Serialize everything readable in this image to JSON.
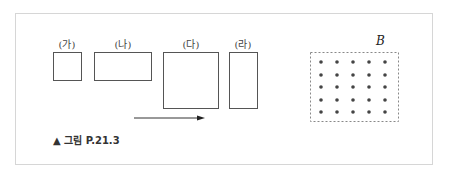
{
  "figure": {
    "caption": "▲ 그림 P.21.3",
    "boxes": [
      {
        "label": "(가)",
        "x": 53,
        "y": 52,
        "w": 29,
        "h": 29
      },
      {
        "label": "(나)",
        "x": 94,
        "y": 52,
        "w": 58,
        "h": 29
      },
      {
        "label": "(다)",
        "x": 163,
        "y": 52,
        "w": 56,
        "h": 57
      },
      {
        "label": "(라)",
        "x": 229,
        "y": 52,
        "w": 29,
        "h": 57
      }
    ],
    "arrow": {
      "x1": 134,
      "y1": 118,
      "x2": 204,
      "y2": 118,
      "direction": "right"
    },
    "field": {
      "label": "B",
      "rect": {
        "x": 310,
        "y": 52,
        "w": 88,
        "h": 69
      },
      "dot_rows": 5,
      "dot_cols": 5,
      "dot_x": [
        321,
        337,
        353,
        369,
        385
      ],
      "dot_y": [
        62,
        75,
        87,
        100,
        112
      ]
    },
    "colors": {
      "box_stroke": "#555555",
      "dot": "#444444",
      "frame": "#d6d6d6",
      "dashed": "#888888"
    }
  }
}
